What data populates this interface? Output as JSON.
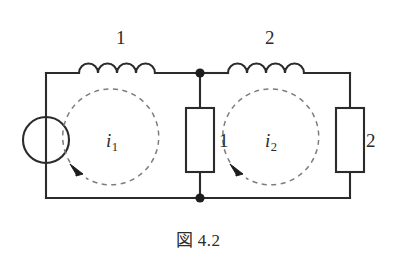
{
  "figure": {
    "caption": "図 4.2",
    "background_color": "#ffffff",
    "line_color": "#2b2b2b",
    "dashed_color": "#7d7d7d"
  },
  "components": {
    "source": {
      "name": "voltage-source",
      "symbol": "circle-with-vertical-bar",
      "label": ""
    },
    "inductor_1": {
      "name": "inductor-left",
      "symbol": "coil",
      "label": "1",
      "humps": 4
    },
    "inductor_2": {
      "name": "inductor-right",
      "symbol": "coil",
      "label": "2",
      "humps": 4
    },
    "resistor_1": {
      "name": "resistor-middle",
      "symbol": "rectangle",
      "label": "1"
    },
    "resistor_2": {
      "name": "resistor-right",
      "symbol": "rectangle",
      "label": "2"
    }
  },
  "loops": {
    "loop_1": {
      "name": "mesh-current-left",
      "label": "i",
      "subscript": "1",
      "direction": "clockwise",
      "arrow_glyph": "arrowhead"
    },
    "loop_2": {
      "name": "mesh-current-right",
      "label": "i",
      "subscript": "2",
      "direction": "clockwise",
      "arrow_glyph": "arrowhead"
    }
  },
  "nodes": [
    {
      "name": "junction-top",
      "type": "filled-dot"
    },
    {
      "name": "junction-bottom",
      "type": "filled-dot"
    }
  ]
}
